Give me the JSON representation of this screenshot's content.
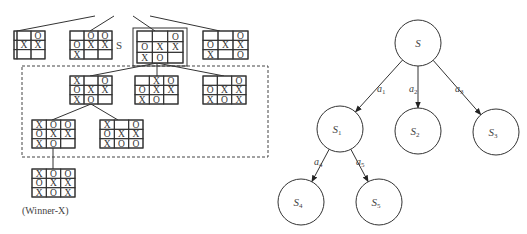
{
  "left_tree": {
    "root_label": "S",
    "winner_label": "(Winner-X)",
    "boards": [
      {
        "id": "top-1",
        "cells": [
          [
            "",
            "",
            "O"
          ],
          [
            "",
            "X",
            "X"
          ],
          [
            "",
            "",
            ""
          ]
        ]
      },
      {
        "id": "top-2",
        "cells": [
          [
            "",
            "O",
            "O"
          ],
          [
            "O",
            "X",
            "X"
          ],
          [
            "X",
            "",
            ""
          ]
        ]
      },
      {
        "id": "top-s",
        "cells": [
          [
            "",
            "",
            "O"
          ],
          [
            "O",
            "X",
            "X"
          ],
          [
            "X",
            "O",
            ""
          ]
        ],
        "highlighted": true
      },
      {
        "id": "top-4",
        "cells": [
          [
            "",
            "",
            "O"
          ],
          [
            "O",
            "X",
            "X"
          ],
          [
            "X",
            "",
            "O"
          ]
        ]
      },
      {
        "id": "mid-1",
        "cells": [
          [
            "X",
            "",
            "O"
          ],
          [
            "O",
            "X",
            "X"
          ],
          [
            "X",
            "O",
            ""
          ]
        ]
      },
      {
        "id": "mid-2",
        "cells": [
          [
            "",
            "X",
            "O"
          ],
          [
            "O",
            "X",
            "X"
          ],
          [
            "X",
            "O",
            ""
          ]
        ]
      },
      {
        "id": "mid-3",
        "cells": [
          [
            "",
            "",
            "O"
          ],
          [
            "O",
            "X",
            "X"
          ],
          [
            "X",
            "O",
            "X"
          ]
        ]
      },
      {
        "id": "low-1",
        "cells": [
          [
            "X",
            "O",
            "O"
          ],
          [
            "O",
            "X",
            "X"
          ],
          [
            "X",
            "O",
            ""
          ]
        ]
      },
      {
        "id": "low-2",
        "cells": [
          [
            "X",
            "",
            "O"
          ],
          [
            "O",
            "X",
            "X"
          ],
          [
            "X",
            "O",
            "O"
          ]
        ]
      },
      {
        "id": "winner",
        "cells": [
          [
            "X",
            "O",
            "O"
          ],
          [
            "O",
            "X",
            "X"
          ],
          [
            "X",
            "O",
            "X"
          ]
        ]
      }
    ]
  },
  "right_tree": {
    "nodes": [
      {
        "id": "S",
        "label": "S",
        "sub": ""
      },
      {
        "id": "S1",
        "label": "S",
        "sub": "1"
      },
      {
        "id": "S2",
        "label": "S",
        "sub": "2"
      },
      {
        "id": "S3",
        "label": "S",
        "sub": "3"
      },
      {
        "id": "S4",
        "label": "S",
        "sub": "4"
      },
      {
        "id": "S5",
        "label": "S",
        "sub": "5"
      }
    ],
    "edges": [
      {
        "from": "S",
        "to": "S1",
        "label": "a",
        "sub": "1"
      },
      {
        "from": "S",
        "to": "S2",
        "label": "a",
        "sub": "2"
      },
      {
        "from": "S",
        "to": "S3",
        "label": "a",
        "sub": "3"
      },
      {
        "from": "S1",
        "to": "S4",
        "label": "a",
        "sub": "4"
      },
      {
        "from": "S1",
        "to": "S5",
        "label": "a",
        "sub": "5"
      }
    ]
  }
}
